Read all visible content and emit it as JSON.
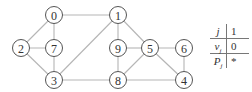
{
  "graph": {
    "nodes": [
      {
        "id": "0",
        "x": 54,
        "y": 15
      },
      {
        "id": "1",
        "x": 118,
        "y": 15
      },
      {
        "id": "2",
        "x": 21,
        "y": 48
      },
      {
        "id": "7",
        "x": 54,
        "y": 48
      },
      {
        "id": "9",
        "x": 118,
        "y": 48
      },
      {
        "id": "5",
        "x": 150,
        "y": 48
      },
      {
        "id": "6",
        "x": 184,
        "y": 48
      },
      {
        "id": "3",
        "x": 54,
        "y": 80
      },
      {
        "id": "8",
        "x": 118,
        "y": 80
      },
      {
        "id": "4",
        "x": 184,
        "y": 80
      }
    ],
    "edges": [
      [
        "0",
        "1"
      ],
      [
        "0",
        "2"
      ],
      [
        "0",
        "7"
      ],
      [
        "2",
        "7"
      ],
      [
        "2",
        "3"
      ],
      [
        "7",
        "3"
      ],
      [
        "3",
        "1"
      ],
      [
        "3",
        "8"
      ],
      [
        "1",
        "9"
      ],
      [
        "1",
        "5"
      ],
      [
        "9",
        "5"
      ],
      [
        "9",
        "8"
      ],
      [
        "5",
        "6"
      ],
      [
        "5",
        "8"
      ],
      [
        "5",
        "4"
      ],
      [
        "6",
        "4"
      ],
      [
        "8",
        "4"
      ]
    ],
    "colors": {
      "edge": "#b5b5b5",
      "node_stroke": "#555555"
    }
  },
  "table": {
    "rows": [
      {
        "header": "j",
        "value": "1"
      },
      {
        "header": "v_j",
        "value": "0"
      },
      {
        "header": "P_j",
        "value": "*"
      }
    ]
  }
}
